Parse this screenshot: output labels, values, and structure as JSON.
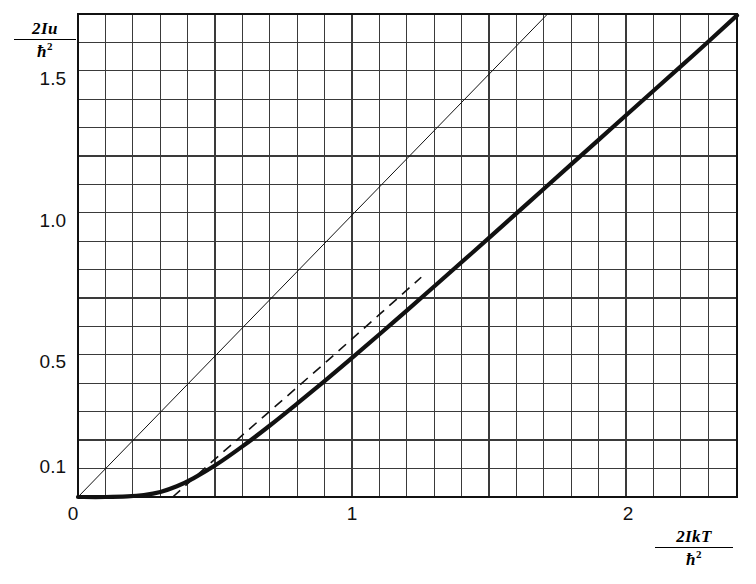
{
  "figure": {
    "background": "#ffffff",
    "ink_color": "#111111",
    "grid_color": "#3a3a3a"
  },
  "axes": {
    "y_axis_label_numerator": "2Iu",
    "y_axis_label_denominator": "ħ",
    "y_axis_label_denominator_exponent": "2",
    "x_axis_label_numerator": "2IkT",
    "x_axis_label_denominator": "ħ",
    "x_axis_label_denominator_exponent": "2",
    "origin_label": "0",
    "y_ticks": [
      "1.5",
      "1.0",
      "0.5",
      "0.1"
    ],
    "x_ticks": [
      "1",
      "2"
    ]
  },
  "chart_data": {
    "type": "line",
    "title": "",
    "subtitle": "",
    "xlabel": "2IkT/ħ²",
    "ylabel": "2Iu/ħ²",
    "xlim": [
      0,
      2.4
    ],
    "ylim": [
      0,
      1.71
    ],
    "grid": true,
    "grid_x_step": 0.1,
    "grid_y_step": 0.1,
    "legend": "none",
    "annotations": [],
    "y_tick_values": [
      0.1,
      0.5,
      1.0,
      1.5
    ],
    "y_tick_labels": [
      "0.1",
      "0.5",
      "1.0",
      "1.5"
    ],
    "x_tick_values": [
      1,
      2
    ],
    "x_tick_labels": [
      "1",
      "2"
    ],
    "series": [
      {
        "name": "classical-line-u-equals-kT",
        "style": "thin-solid",
        "linewidth": 1.0,
        "color": "#111111",
        "x": [
          0.0,
          0.4,
          0.8,
          1.2,
          1.6,
          1.71
        ],
        "y": [
          0.0,
          0.4,
          0.8,
          1.2,
          1.6,
          1.71
        ]
      },
      {
        "name": "quantum-rotational-energy",
        "style": "thick-solid",
        "linewidth": 4.2,
        "color": "#111111",
        "x": [
          0.0,
          0.1,
          0.18,
          0.24,
          0.3,
          0.36,
          0.42,
          0.5,
          0.6,
          0.7,
          0.8,
          0.9,
          1.0,
          1.15,
          1.3,
          1.5,
          1.7,
          1.9,
          2.1,
          2.25,
          2.4
        ],
        "y": [
          0.0,
          0.0,
          0.002,
          0.007,
          0.018,
          0.038,
          0.066,
          0.112,
          0.18,
          0.254,
          0.332,
          0.412,
          0.494,
          0.62,
          0.748,
          0.92,
          1.094,
          1.268,
          1.442,
          1.572,
          1.705
        ]
      },
      {
        "name": "asymptote-dashed",
        "style": "dashed",
        "linewidth": 1.6,
        "dash_pattern": "10 7",
        "color": "#111111",
        "x": [
          0.345,
          0.5,
          0.7,
          0.9,
          1.1,
          1.25
        ],
        "y": [
          0.0,
          0.135,
          0.305,
          0.475,
          0.648,
          0.778
        ]
      }
    ]
  }
}
